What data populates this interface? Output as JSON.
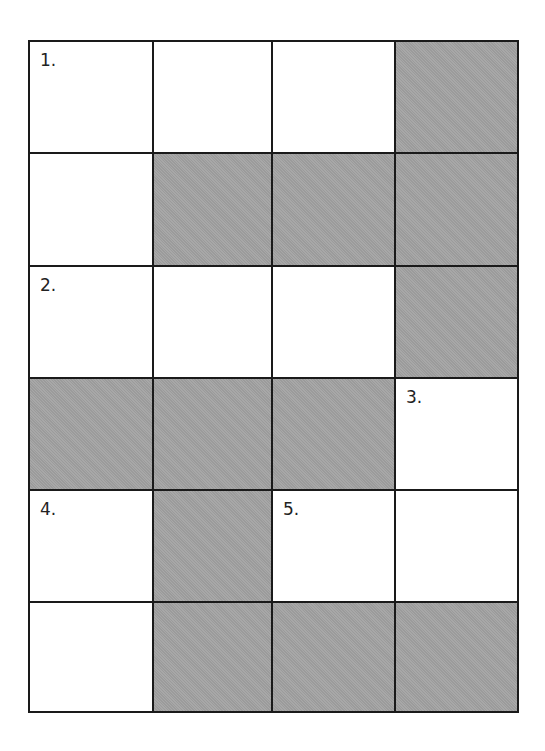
{
  "puzzle": {
    "type": "crossword",
    "rows": 6,
    "cols": 4,
    "colors": {
      "blocked": "#a3a3a3",
      "open": "#ffffff",
      "border": "#1a1a1a"
    },
    "cells": [
      [
        {
          "blocked": false,
          "number": "1."
        },
        {
          "blocked": false,
          "number": ""
        },
        {
          "blocked": false,
          "number": ""
        },
        {
          "blocked": true,
          "number": ""
        }
      ],
      [
        {
          "blocked": false,
          "number": ""
        },
        {
          "blocked": true,
          "number": ""
        },
        {
          "blocked": true,
          "number": ""
        },
        {
          "blocked": true,
          "number": ""
        }
      ],
      [
        {
          "blocked": false,
          "number": "2."
        },
        {
          "blocked": false,
          "number": ""
        },
        {
          "blocked": false,
          "number": ""
        },
        {
          "blocked": true,
          "number": ""
        }
      ],
      [
        {
          "blocked": true,
          "number": ""
        },
        {
          "blocked": true,
          "number": ""
        },
        {
          "blocked": true,
          "number": ""
        },
        {
          "blocked": false,
          "number": "3."
        }
      ],
      [
        {
          "blocked": false,
          "number": "4."
        },
        {
          "blocked": true,
          "number": ""
        },
        {
          "blocked": false,
          "number": "5."
        },
        {
          "blocked": false,
          "number": ""
        }
      ],
      [
        {
          "blocked": false,
          "number": ""
        },
        {
          "blocked": true,
          "number": ""
        },
        {
          "blocked": true,
          "number": ""
        },
        {
          "blocked": true,
          "number": ""
        }
      ]
    ]
  }
}
